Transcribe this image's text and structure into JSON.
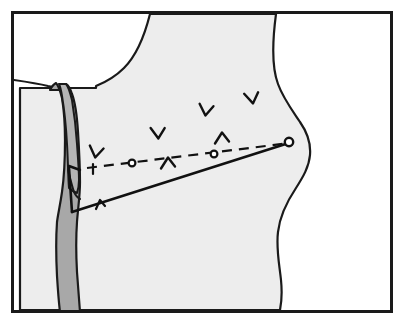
{
  "figure": {
    "title": "Lateral body profile surgical approach illustration",
    "type": "line-art-anatomical-diagram",
    "width": 408,
    "height": 326,
    "background_color": "#ffffff"
  },
  "frame": {
    "name": "illustration-border",
    "x": 11,
    "y": 11,
    "width": 382,
    "height": 302,
    "stroke_color": "#1a1a1a",
    "stroke_width": 3,
    "fill_color": "#ffffff"
  },
  "body": {
    "name": "body-silhouette",
    "fill_color": "#ededed",
    "stroke_color": "#1a1a1a",
    "stroke_width": 2.2,
    "description": "Large light gray body mass occupying center and right of frame with concave upper-left curve and sinuous right contour"
  },
  "band": {
    "name": "tendon-band",
    "fill_color": "#a8a8a8",
    "stroke_color": "#1a1a1a",
    "stroke_width": 2.2,
    "description": "Darker gray vertical band running from pointed apex near top down to bottom border on the left side"
  },
  "band_inner": {
    "name": "tendon-band-split",
    "fill_color": "#b5b5b5",
    "stroke_color": "#1a1a1a",
    "description": "Narrow inner leaflet of the band forming a notched double-peak at the apex"
  },
  "incision_line": {
    "name": "incision-line",
    "stroke_color": "#111111",
    "stroke_width": 2.6,
    "start": [
      72,
      212
    ],
    "vertex": [
      69,
      168
    ],
    "end": [
      292,
      142
    ],
    "description": "Solid angled incision line with upper vertical leg and long diagonal running to upper right"
  },
  "incision_ticks": [
    {
      "name": "incision-tick-1",
      "x": 100,
      "y": 204,
      "rotation": -7
    },
    {
      "name": "incision-tick-2",
      "x": 66,
      "y": 181,
      "rotation": 0
    }
  ],
  "dashed_pointer": {
    "name": "dashed-pointer-line",
    "stroke_color": "#111111",
    "stroke_width": 2.2,
    "dash_pattern": "10 7",
    "start": [
      87,
      168
    ],
    "end": [
      290,
      143
    ],
    "description": "Dashed annotation line traveling from left to upper right, punctuated by small open circles"
  },
  "pointer_markers": [
    {
      "name": "pointer-circle-left",
      "cx": 132,
      "cy": 163,
      "r": 3.4
    },
    {
      "name": "pointer-circle-mid",
      "cx": 214,
      "cy": 154,
      "r": 3.4
    },
    {
      "name": "pointer-circle-right",
      "cx": 289,
      "cy": 142,
      "r": 4.2
    }
  ],
  "pointer_tail": {
    "name": "pointer-tail-tick",
    "x": 93,
    "y": 168,
    "description": "Small cross tick at the left tail end of the dashed pointer"
  },
  "fiber_marks": [
    {
      "name": "fiber-mark-1",
      "x": 96,
      "y": 152,
      "rotation": 8,
      "shape": "v"
    },
    {
      "name": "fiber-mark-2",
      "x": 158,
      "y": 133,
      "rotation": -4,
      "shape": "v"
    },
    {
      "name": "fiber-mark-3",
      "x": 206,
      "y": 110,
      "rotation": 6,
      "shape": "v"
    },
    {
      "name": "fiber-mark-4",
      "x": 252,
      "y": 98,
      "rotation": -10,
      "shape": "v"
    },
    {
      "name": "fiber-mark-5",
      "x": 168,
      "y": 163,
      "rotation": 0,
      "shape": "caret"
    },
    {
      "name": "fiber-mark-6",
      "x": 222,
      "y": 138,
      "rotation": 0,
      "shape": "caret"
    }
  ],
  "legend": {
    "items": []
  }
}
